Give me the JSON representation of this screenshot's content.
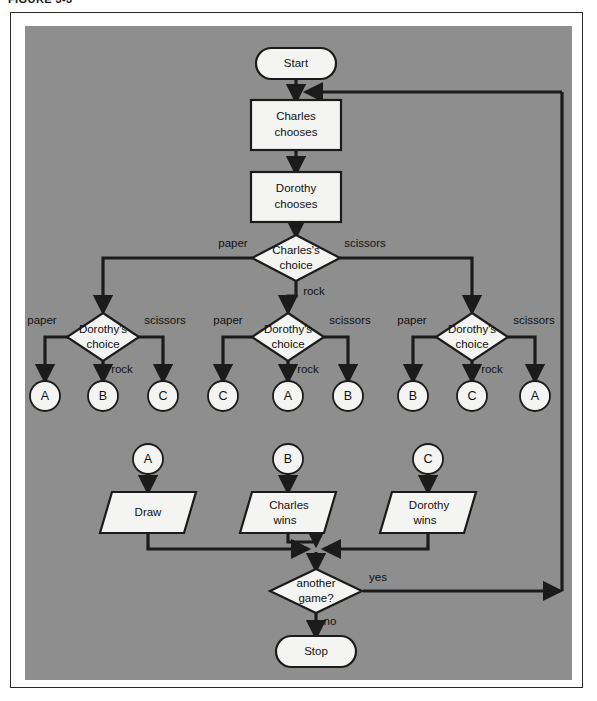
{
  "figure": {
    "caption": "FIGURE 3-3"
  },
  "colors": {
    "panel_gray": "#8e8e8e",
    "shape_fill": "#f4f4f2",
    "stroke": "#1b1b1b",
    "page_white": "#ffffff"
  },
  "diagram": {
    "type": "flowchart",
    "terminators": [
      {
        "id": "start",
        "label": "Start",
        "x": 296,
        "y": 63
      },
      {
        "id": "stop",
        "label": "Stop",
        "x": 316,
        "y": 651
      }
    ],
    "processes": [
      {
        "id": "charles_chooses",
        "label_line1": "Charles",
        "label_line2": "chooses",
        "x": 296,
        "y": 124
      },
      {
        "id": "dorothy_chooses",
        "label_line1": "Dorothy",
        "label_line2": "chooses",
        "x": 296,
        "y": 196
      }
    ],
    "decisions": [
      {
        "id": "charles_choice",
        "label_line1": "Charles's",
        "label_line2": "choice",
        "x": 296,
        "y": 258
      },
      {
        "id": "dorothy_choice_left",
        "label_line1": "Dorothy's",
        "label_line2": "choice",
        "x": 103,
        "y": 337
      },
      {
        "id": "dorothy_choice_mid",
        "label_line1": "Dorothy's",
        "label_line2": "choice",
        "x": 288,
        "y": 337
      },
      {
        "id": "dorothy_choice_right",
        "label_line1": "Dorothy's",
        "label_line2": "choice",
        "x": 472,
        "y": 337
      },
      {
        "id": "another_game",
        "label_line1": "another",
        "label_line2": "game?",
        "x": 316,
        "y": 591
      }
    ],
    "outputs": [
      {
        "id": "draw",
        "label_line1": "Draw",
        "label_line2": "",
        "x": 148,
        "y": 512
      },
      {
        "id": "charles_wins",
        "label_line1": "Charles",
        "label_line2": "wins",
        "x": 288,
        "y": 512
      },
      {
        "id": "dorothy_wins",
        "label_line1": "Dorothy",
        "label_line2": "wins",
        "x": 428,
        "y": 512
      }
    ],
    "connectors_out": [
      {
        "id": "c1",
        "letter": "A",
        "x": 45,
        "y": 396
      },
      {
        "id": "c2",
        "letter": "B",
        "x": 103,
        "y": 396
      },
      {
        "id": "c3",
        "letter": "C",
        "x": 163,
        "y": 396
      },
      {
        "id": "c4",
        "letter": "C",
        "x": 223,
        "y": 396
      },
      {
        "id": "c5",
        "letter": "A",
        "x": 288,
        "y": 396
      },
      {
        "id": "c6",
        "letter": "B",
        "x": 348,
        "y": 396
      },
      {
        "id": "c7",
        "letter": "B",
        "x": 413,
        "y": 396
      },
      {
        "id": "c8",
        "letter": "C",
        "x": 472,
        "y": 396
      },
      {
        "id": "c9",
        "letter": "A",
        "x": 535,
        "y": 396
      }
    ],
    "connectors_in": [
      {
        "id": "ci_a",
        "letter": "A",
        "x": 148,
        "y": 459
      },
      {
        "id": "ci_b",
        "letter": "B",
        "x": 288,
        "y": 459
      },
      {
        "id": "ci_c",
        "letter": "C",
        "x": 428,
        "y": 459
      }
    ],
    "edge_labels": [
      {
        "id": "charles_paper",
        "text": "paper",
        "x": 233,
        "y": 244
      },
      {
        "id": "charles_scissors",
        "text": "scissors",
        "x": 365,
        "y": 244
      },
      {
        "id": "charles_rock",
        "text": "rock",
        "x": 314,
        "y": 292
      },
      {
        "id": "left_paper",
        "text": "paper",
        "x": 42,
        "y": 321
      },
      {
        "id": "left_scissors",
        "text": "scissors",
        "x": 165,
        "y": 321
      },
      {
        "id": "left_rock",
        "text": "rock",
        "x": 122,
        "y": 370
      },
      {
        "id": "mid_paper",
        "text": "paper",
        "x": 228,
        "y": 321
      },
      {
        "id": "mid_scissors",
        "text": "scissors",
        "x": 350,
        "y": 321
      },
      {
        "id": "mid_rock",
        "text": "rock",
        "x": 308,
        "y": 370
      },
      {
        "id": "right_paper",
        "text": "paper",
        "x": 412,
        "y": 321
      },
      {
        "id": "right_scissors",
        "text": "scissors",
        "x": 534,
        "y": 321
      },
      {
        "id": "right_rock",
        "text": "rock",
        "x": 492,
        "y": 370
      },
      {
        "id": "game_yes",
        "text": "yes",
        "x": 378,
        "y": 578
      },
      {
        "id": "game_no",
        "text": "no",
        "x": 330,
        "y": 622
      }
    ],
    "flow_summary": [
      "Start → Charles chooses → Dorothy chooses → Charles's choice",
      "Charles's choice: paper → left Dorothy's choice; rock → middle Dorothy's choice; scissors → right Dorothy's choice",
      "Left (Charles paper): paper → A, rock → B, scissors → C",
      "Middle (Charles rock): paper → C, rock → A, scissors → B",
      "Right (Charles scissors): paper → B, rock → C, scissors → A",
      "A → Draw, B → Charles wins, C → Dorothy wins",
      "All outputs → another game? : yes → back to Charles chooses, no → Stop"
    ]
  }
}
